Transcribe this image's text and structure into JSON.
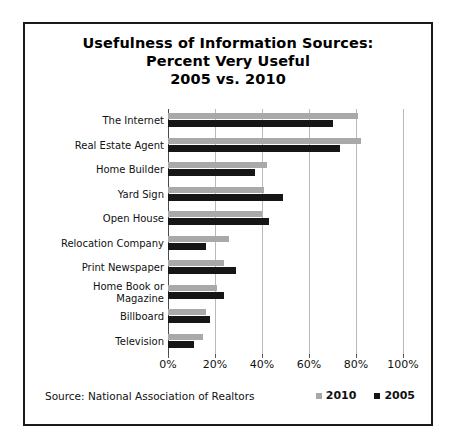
{
  "chart_data": {
    "type": "bar",
    "orientation": "horizontal",
    "title": "Usefulness of Information Sources: Percent Very Useful 2005 vs. 2010",
    "title_lines": [
      "Usefulness of Information Sources:",
      "Percent Very Useful",
      "2005 vs. 2010"
    ],
    "xlabel": "",
    "ylabel": "",
    "xlim": [
      0,
      100
    ],
    "xticks": [
      0,
      20,
      40,
      60,
      80,
      100
    ],
    "xtick_labels": [
      "0%",
      "20%",
      "40%",
      "60%",
      "80%",
      "100%"
    ],
    "grid": true,
    "legend_position": "bottom-right",
    "categories": [
      "The Internet",
      "Real Estate Agent",
      "Home Builder",
      "Yard Sign",
      "Open House",
      "Relocation Company",
      "Print Newspaper",
      "Home Book or Magazine",
      "Billboard",
      "Television"
    ],
    "series": [
      {
        "name": "2010",
        "color": "#a9a9a9",
        "values": [
          81,
          82,
          42,
          41,
          40,
          26,
          24,
          21,
          16,
          15
        ]
      },
      {
        "name": "2005",
        "color": "#161616",
        "values": [
          70,
          73,
          37,
          49,
          43,
          16,
          29,
          24,
          18,
          11
        ]
      }
    ],
    "source": "Source: National Association of Realtors"
  },
  "footer": {
    "source_text": "Source: National Association of Realtors"
  }
}
